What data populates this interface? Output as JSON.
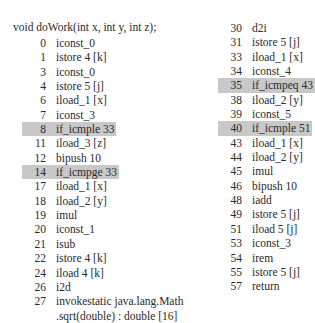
{
  "signature": "void doWork(int x, int y, int z);",
  "highlight_color": "#c8c8c8",
  "left_column": [
    {
      "offset": "0",
      "instr": "iconst_0",
      "highlight": false
    },
    {
      "offset": "1",
      "instr": "istore 4 [k]",
      "highlight": false
    },
    {
      "offset": "3",
      "instr": "iconst_0",
      "highlight": false
    },
    {
      "offset": "4",
      "instr": "istore 5 [j]",
      "highlight": false
    },
    {
      "offset": "6",
      "instr": "iload_1 [x]",
      "highlight": false
    },
    {
      "offset": "7",
      "instr": "iconst_3",
      "highlight": false
    },
    {
      "offset": "8",
      "instr": "if_icmple 33",
      "highlight": true
    },
    {
      "offset": "11",
      "instr": "iload_3 [z]",
      "highlight": false
    },
    {
      "offset": "12",
      "instr": "bipush 10",
      "highlight": false
    },
    {
      "offset": "14",
      "instr": "if_icmpge 33",
      "highlight": true
    },
    {
      "offset": "17",
      "instr": "iload_1 [x]",
      "highlight": false
    },
    {
      "offset": "18",
      "instr": "iload_2 [y]",
      "highlight": false
    },
    {
      "offset": "19",
      "instr": "imul",
      "highlight": false
    },
    {
      "offset": "20",
      "instr": "iconst_1",
      "highlight": false
    },
    {
      "offset": "21",
      "instr": "isub",
      "highlight": false
    },
    {
      "offset": "22",
      "instr": "istore 4 [k]",
      "highlight": false
    },
    {
      "offset": "24",
      "instr": "iload 4 [k]",
      "highlight": false
    },
    {
      "offset": "26",
      "instr": "i2d",
      "highlight": false
    },
    {
      "offset": "27",
      "instr": "invokestatic java.lang.Math",
      "highlight": false
    }
  ],
  "left_continuation": ".sqrt(double) : double [16]",
  "right_column": [
    {
      "offset": "30",
      "instr": "d2i",
      "highlight": false
    },
    {
      "offset": "31",
      "instr": "istore 5 [j]",
      "highlight": false
    },
    {
      "offset": "33",
      "instr": "iload_1 [x]",
      "highlight": false
    },
    {
      "offset": "34",
      "instr": "iconst_4",
      "highlight": false
    },
    {
      "offset": "35",
      "instr": "if_icmpeq 43",
      "highlight": true
    },
    {
      "offset": "38",
      "instr": "iload_2 [y]",
      "highlight": false
    },
    {
      "offset": "39",
      "instr": "iconst_5",
      "highlight": false
    },
    {
      "offset": "40",
      "instr": "if_icmple 51",
      "highlight": true
    },
    {
      "offset": "43",
      "instr": "iload_1 [x]",
      "highlight": false
    },
    {
      "offset": "44",
      "instr": "iload_2 [y]",
      "highlight": false
    },
    {
      "offset": "45",
      "instr": "imul",
      "highlight": false
    },
    {
      "offset": "46",
      "instr": "bipush 10",
      "highlight": false
    },
    {
      "offset": "48",
      "instr": "iadd",
      "highlight": false
    },
    {
      "offset": "49",
      "instr": "istore 5 [j]",
      "highlight": false
    },
    {
      "offset": "51",
      "instr": "iload 5 [j]",
      "highlight": false
    },
    {
      "offset": "53",
      "instr": "iconst_3",
      "highlight": false
    },
    {
      "offset": "54",
      "instr": "irem",
      "highlight": false
    },
    {
      "offset": "55",
      "instr": "istore 5 [j]",
      "highlight": false
    },
    {
      "offset": "57",
      "instr": "return",
      "highlight": false
    }
  ]
}
